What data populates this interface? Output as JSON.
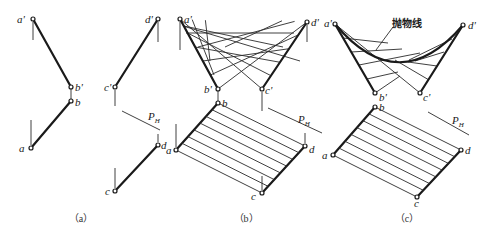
{
  "figure": {
    "panels": [
      {
        "id": "a",
        "caption": "（a）",
        "labels": {
          "a_prime": "a'",
          "b_prime": "b'",
          "b": "b",
          "a": "a",
          "c_prime": "c'",
          "d_prime": "d'",
          "c": "c",
          "d": "d",
          "plane": "P",
          "plane_sub": "H"
        }
      },
      {
        "id": "b",
        "caption": "（b）",
        "labels": {
          "a_prime": "a'",
          "d_prime": "d'",
          "b_prime": "b'",
          "c_prime": "c'",
          "b": "b",
          "a": "a",
          "d": "d",
          "c": "c",
          "plane": "P",
          "plane_sub": "H"
        }
      },
      {
        "id": "c",
        "caption": "（c）",
        "annotation": "抛物线",
        "labels": {
          "a_prime": "a'",
          "d_prime": "d'",
          "b_prime": "b'",
          "c_prime": "c'",
          "b": "b",
          "a": "a",
          "d": "d",
          "c": "c",
          "plane": "P",
          "plane_sub": "H"
        }
      }
    ]
  }
}
